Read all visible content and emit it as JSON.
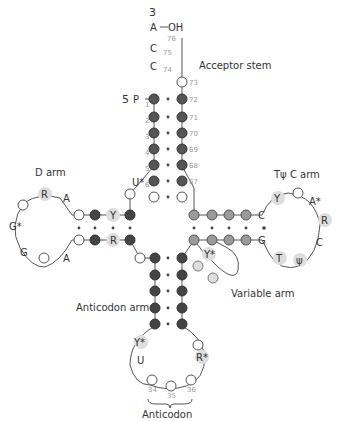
{
  "colors": {
    "dark": "#3a3a3a",
    "mid": "#8c8c8c",
    "light": "#d8d8d8",
    "open": "#ffffff",
    "highlight": "#d9d9d9",
    "line": "#555555"
  },
  "labels": {
    "three_prime": "3",
    "five_prime": "5",
    "phosphate": "P",
    "oh": "OH",
    "acceptor_stem": "Acceptor stem",
    "d_arm": "D arm",
    "tpsic_arm": "Tψ C arm",
    "variable_arm": "Variable arm",
    "anticodon_arm": "Anticodon arm",
    "anticodon": "Anticodon"
  },
  "acceptor": {
    "terminal": [
      "A",
      "C",
      "C"
    ],
    "terminal_numbers": [
      "76",
      "75",
      "74"
    ],
    "left_numbers": [
      "1",
      "2",
      "3",
      "4",
      "5",
      "6"
    ],
    "right_numbers": [
      "73",
      "72",
      "71",
      "70",
      "69",
      "68",
      "67"
    ],
    "u_star": "U*"
  },
  "d_arm": {
    "loop_letters": [
      "R",
      "A",
      "G*",
      "G",
      "A"
    ],
    "stem_letters": [
      "Y",
      "R"
    ]
  },
  "tpsic_arm": {
    "loop_letters": [
      "C",
      "Y",
      "A*",
      "R",
      "C",
      "ψ",
      "T",
      "G"
    ]
  },
  "variable_arm": {
    "letters": [
      "Y*"
    ]
  },
  "anticodon_arm": {
    "loop_letters": [
      "Y*",
      "U",
      "R*"
    ],
    "numbers": [
      "34",
      "35",
      "36"
    ]
  }
}
